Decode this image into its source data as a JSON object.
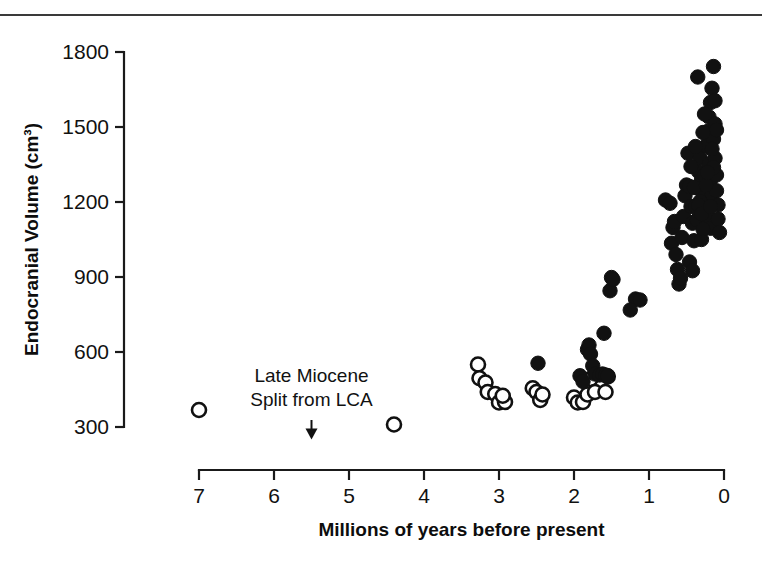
{
  "figure": {
    "name": "endocranial-volume-scatter",
    "has_top_rule": true
  },
  "chart_data": {
    "type": "scatter",
    "title": "",
    "xlabel": "Millions of years before present",
    "ylabel": "Endocranial Volume (cm³)",
    "xlim": [
      7.6,
      -0.25
    ],
    "ylim": [
      260,
      1810
    ],
    "x_reversed": true,
    "grid": false,
    "legend_position": "none",
    "xticks": [
      7,
      6,
      5,
      4,
      3,
      2,
      1,
      0
    ],
    "xtick_labels": [
      "7",
      "6",
      "5",
      "4",
      "3",
      "2",
      "1",
      "0"
    ],
    "yticks": [
      1800,
      1500,
      1200,
      900,
      600,
      300
    ],
    "ytick_labels": [
      "1800",
      "1500",
      "1200",
      "900",
      "600",
      "300"
    ],
    "annotations": [
      {
        "name": "late-miocene-split",
        "line1": "Late Miocene",
        "line2": "Split from LCA",
        "x": 5.5,
        "arrow_from_y": 520,
        "arrow_to_y": 250
      }
    ],
    "marker_styles": {
      "open": "open circle (hollow)",
      "filled": "filled circle (solid black)"
    },
    "series": [
      {
        "name": "open-circles",
        "marker": "open",
        "color": "#ffffff",
        "edge_color": "#111111",
        "points": [
          [
            7.0,
            368
          ],
          [
            4.4,
            310
          ],
          [
            3.28,
            550
          ],
          [
            3.26,
            495
          ],
          [
            3.18,
            478
          ],
          [
            3.15,
            440
          ],
          [
            3.05,
            432
          ],
          [
            3.0,
            398
          ],
          [
            2.92,
            400
          ],
          [
            2.95,
            425
          ],
          [
            2.55,
            455
          ],
          [
            2.5,
            440
          ],
          [
            2.45,
            408
          ],
          [
            2.42,
            430
          ],
          [
            2.0,
            418
          ],
          [
            1.95,
            398
          ],
          [
            1.88,
            400
          ],
          [
            1.82,
            430
          ],
          [
            1.78,
            492
          ],
          [
            1.72,
            440
          ],
          [
            1.58,
            440
          ],
          [
            1.55,
            502
          ]
        ]
      },
      {
        "name": "filled-circles",
        "marker": "filled",
        "color": "#111111",
        "points": [
          [
            2.48,
            555
          ],
          [
            1.92,
            505
          ],
          [
            1.88,
            482
          ],
          [
            1.82,
            610
          ],
          [
            1.8,
            628
          ],
          [
            1.78,
            592
          ],
          [
            1.75,
            545
          ],
          [
            1.72,
            512
          ],
          [
            1.66,
            508
          ],
          [
            1.62,
            512
          ],
          [
            1.58,
            508
          ],
          [
            1.55,
            505
          ],
          [
            1.6,
            675
          ],
          [
            1.52,
            845
          ],
          [
            1.5,
            898
          ],
          [
            1.48,
            890
          ],
          [
            1.18,
            812
          ],
          [
            1.12,
            808
          ],
          [
            1.25,
            768
          ],
          [
            0.78,
            1208
          ],
          [
            0.72,
            1195
          ],
          [
            0.68,
            1098
          ],
          [
            0.66,
            1122
          ],
          [
            0.7,
            1035
          ],
          [
            0.64,
            990
          ],
          [
            0.62,
            930
          ],
          [
            0.6,
            872
          ],
          [
            0.58,
            895
          ],
          [
            0.56,
            1058
          ],
          [
            0.54,
            1142
          ],
          [
            0.52,
            1225
          ],
          [
            0.5,
            1268
          ],
          [
            0.48,
            1395
          ],
          [
            0.46,
            1262
          ],
          [
            0.44,
            1182
          ],
          [
            0.42,
            1115
          ],
          [
            0.4,
            1045
          ],
          [
            0.46,
            960
          ],
          [
            0.42,
            925
          ],
          [
            0.38,
            1182
          ],
          [
            0.36,
            1258
          ],
          [
            0.34,
            1322
          ],
          [
            0.32,
            1378
          ],
          [
            0.3,
            1288
          ],
          [
            0.28,
            1215
          ],
          [
            0.26,
            1165
          ],
          [
            0.24,
            1105
          ],
          [
            0.35,
            1700
          ],
          [
            0.3,
            1050
          ],
          [
            0.26,
            1308
          ],
          [
            0.24,
            1425
          ],
          [
            0.22,
            1482
          ],
          [
            0.2,
            1540
          ],
          [
            0.18,
            1598
          ],
          [
            0.16,
            1655
          ],
          [
            0.14,
            1742
          ],
          [
            0.2,
            1352
          ],
          [
            0.18,
            1288
          ],
          [
            0.16,
            1232
          ],
          [
            0.22,
            1182
          ],
          [
            0.2,
            1138
          ],
          [
            0.18,
            1095
          ],
          [
            0.14,
            1452
          ],
          [
            0.12,
            1512
          ],
          [
            0.12,
            1375
          ],
          [
            0.1,
            1308
          ],
          [
            0.1,
            1245
          ],
          [
            0.08,
            1188
          ],
          [
            0.08,
            1132
          ],
          [
            0.06,
            1078
          ],
          [
            0.12,
            1605
          ],
          [
            0.1,
            1488
          ],
          [
            0.14,
            1338
          ],
          [
            0.28,
            1478
          ],
          [
            0.26,
            1552
          ],
          [
            0.32,
            1202
          ],
          [
            0.36,
            1128
          ],
          [
            0.4,
            1258
          ],
          [
            0.44,
            1342
          ],
          [
            0.38,
            1422
          ],
          [
            0.34,
            1188
          ],
          [
            0.3,
            1152
          ],
          [
            0.28,
            1092
          ],
          [
            0.24,
            1268
          ],
          [
            0.22,
            1318
          ],
          [
            0.16,
            1412
          ],
          [
            0.18,
            1182
          ]
        ]
      }
    ]
  }
}
